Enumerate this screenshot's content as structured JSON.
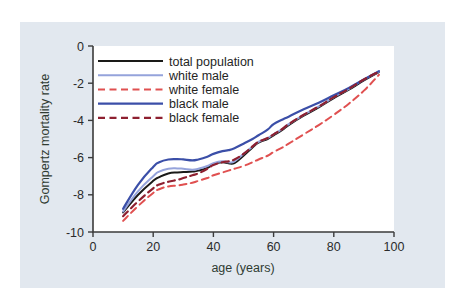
{
  "figure": {
    "background_color": "#e2e8ef",
    "plot_background_color": "#ffffff",
    "axis_color": "#3b3b3b"
  },
  "chart_data": {
    "type": "line",
    "title": "",
    "xlabel": "age (years)",
    "ylabel": "Gompertz mortality rate",
    "xlim": [
      0,
      100
    ],
    "ylim": [
      -10,
      0
    ],
    "xticks": [
      0,
      20,
      40,
      60,
      80,
      100
    ],
    "yticks": [
      0,
      -2,
      -4,
      -6,
      -8,
      -10
    ],
    "xtick_labels": [
      "0",
      "20",
      "40",
      "60",
      "80",
      "100"
    ],
    "ytick_labels": [
      "0",
      "-2",
      "-4",
      "-6",
      "-8",
      "-10"
    ],
    "grid": false,
    "legend_position": "upper left",
    "x": [
      10,
      15,
      20,
      22,
      25,
      28,
      30,
      33,
      35,
      38,
      40,
      43,
      45,
      47,
      50,
      53,
      55,
      58,
      60,
      63,
      65,
      70,
      75,
      80,
      85,
      90,
      95
    ],
    "series": [
      {
        "name": "total population",
        "color": "#1a1a18",
        "style": "solid",
        "width": 2.0,
        "values": [
          -8.95,
          -8.0,
          -7.25,
          -7.05,
          -6.85,
          -6.8,
          -6.78,
          -6.75,
          -6.7,
          -6.55,
          -6.35,
          -6.25,
          -6.3,
          -6.3,
          -5.9,
          -5.45,
          -5.2,
          -5.0,
          -4.8,
          -4.5,
          -4.25,
          -3.75,
          -3.3,
          -2.8,
          -2.35,
          -1.85,
          -1.4
        ]
      },
      {
        "name": "white male",
        "color": "#95a3db",
        "style": "solid",
        "width": 2.0,
        "values": [
          -8.9,
          -7.8,
          -7.0,
          -6.75,
          -6.6,
          -6.58,
          -6.6,
          -6.65,
          -6.6,
          -6.45,
          -6.3,
          -6.2,
          -6.25,
          -6.2,
          -5.8,
          -5.4,
          -5.15,
          -4.95,
          -4.75,
          -4.45,
          -4.2,
          -3.7,
          -3.25,
          -2.75,
          -2.3,
          -1.8,
          -1.38
        ]
      },
      {
        "name": "white female",
        "color": "#e05050",
        "style": "dashed",
        "width": 2.0,
        "values": [
          -9.4,
          -8.6,
          -7.9,
          -7.7,
          -7.55,
          -7.5,
          -7.45,
          -7.35,
          -7.25,
          -7.1,
          -6.95,
          -6.8,
          -6.7,
          -6.6,
          -6.45,
          -6.25,
          -6.1,
          -5.9,
          -5.7,
          -5.45,
          -5.25,
          -4.75,
          -4.25,
          -3.7,
          -3.1,
          -2.4,
          -1.55
        ]
      },
      {
        "name": "black male",
        "color": "#3b4fa8",
        "style": "solid",
        "width": 2.2,
        "values": [
          -8.75,
          -7.45,
          -6.5,
          -6.25,
          -6.1,
          -6.08,
          -6.1,
          -6.15,
          -6.1,
          -5.95,
          -5.8,
          -5.65,
          -5.6,
          -5.5,
          -5.25,
          -5.0,
          -4.8,
          -4.5,
          -4.2,
          -3.95,
          -3.8,
          -3.4,
          -3.05,
          -2.65,
          -2.25,
          -1.8,
          -1.35
        ]
      },
      {
        "name": "black female",
        "color": "#8e2030",
        "style": "dashed",
        "width": 2.2,
        "values": [
          -9.15,
          -8.35,
          -7.65,
          -7.45,
          -7.3,
          -7.2,
          -7.1,
          -6.95,
          -6.85,
          -6.6,
          -6.4,
          -6.25,
          -6.2,
          -6.1,
          -5.8,
          -5.4,
          -5.15,
          -4.95,
          -4.75,
          -4.45,
          -4.2,
          -3.7,
          -3.25,
          -2.75,
          -2.3,
          -1.8,
          -1.38
        ]
      }
    ]
  },
  "legend": {
    "entries": [
      {
        "label": "total population"
      },
      {
        "label": "white male"
      },
      {
        "label": "white female"
      },
      {
        "label": "black male"
      },
      {
        "label": "black female"
      }
    ]
  }
}
